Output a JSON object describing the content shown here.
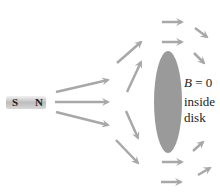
{
  "magnet": {
    "south_label": "S",
    "north_label": "N"
  },
  "label": {
    "line1": "B = 0",
    "line2": "inside",
    "line3": "disk"
  },
  "colors": {
    "arrow": "#a8a8a8",
    "disk": "#9a9a9a",
    "text": "#222222"
  }
}
